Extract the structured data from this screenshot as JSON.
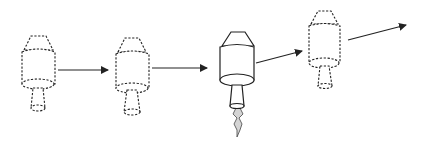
{
  "diagram": {
    "type": "sequence",
    "stages": [
      {
        "index": 1,
        "style": "dashed",
        "firing": false
      },
      {
        "index": 2,
        "style": "dashed",
        "firing": false
      },
      {
        "index": 3,
        "style": "solid",
        "firing": true
      },
      {
        "index": 4,
        "style": "dashed",
        "firing": false
      }
    ],
    "arrows": [
      {
        "from": 1,
        "to": 2,
        "direction": "horizontal"
      },
      {
        "from": 2,
        "to": 3,
        "direction": "horizontal"
      },
      {
        "from": 3,
        "to": 4,
        "direction": "up-right"
      },
      {
        "from": 4,
        "to": "offscreen",
        "direction": "up-right"
      }
    ],
    "colors": {
      "line": "#222222",
      "plume": "#d4d4d4",
      "background": "#ffffff"
    }
  }
}
